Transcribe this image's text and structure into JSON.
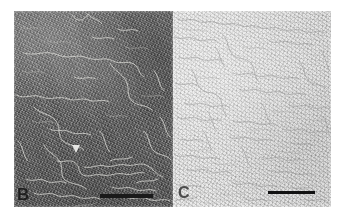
{
  "figure": {
    "type": "micrograph-figure",
    "background_color": "#ffffff",
    "panels": [
      {
        "id": "B",
        "label": "B",
        "label_color": "#1f1f1f",
        "background_color": "#6d6d6d",
        "tone": "dark",
        "content": "dark grainy field with light curvilinear filaments",
        "filament_color": "#d8d8d4",
        "scale_bar": {
          "color": "#1a1a1a",
          "length_px": 53,
          "thickness_px": 4,
          "caption": ""
        },
        "marker": {
          "name": "arrowhead",
          "color": "#eeeeec",
          "shape": "triangle"
        }
      },
      {
        "id": "C",
        "label": "C",
        "label_color": "#4c4c4c",
        "background_color": "#e3e3e2",
        "tone": "light",
        "content": "light grainy field with fine dark filamentous network",
        "filament_color": "#8a8a88",
        "scale_bar": {
          "color": "#121212",
          "length_px": 47,
          "thickness_px": 3,
          "caption": ""
        },
        "marker": null
      }
    ]
  }
}
